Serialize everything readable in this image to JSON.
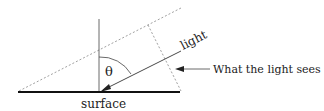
{
  "diagram": {
    "labels": {
      "angle": "θ",
      "light": "light",
      "surface": "surface",
      "annotation": "What the light sees"
    },
    "colors": {
      "line": "#222222",
      "dashed": "#777777",
      "background": "#ffffff"
    }
  }
}
